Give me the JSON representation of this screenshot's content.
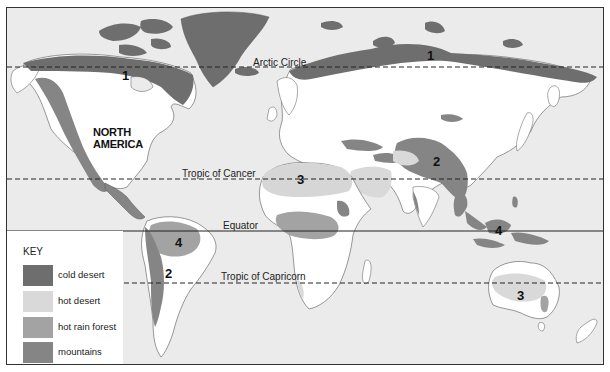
{
  "map": {
    "colors": {
      "ocean": "#ebebeb",
      "land": "#ffffff",
      "cold_desert": "#6e6e6e",
      "hot_desert": "#d6d6d6",
      "hot_rain_forest": "#a8a8a8",
      "mountains": "#8a8a8a",
      "outline": "#555555"
    },
    "lines": {
      "arctic_circle": "Arctic Circle",
      "tropic_of_cancer": "Tropic of Cancer",
      "equator": "Equator",
      "tropic_of_capricorn": "Tropic of Capricorn"
    },
    "labels": {
      "north_america_line1": "NORTH",
      "north_america_line2": "AMERICA"
    },
    "regions": [
      {
        "id": "na-cold-desert",
        "number": "1"
      },
      {
        "id": "eurasia-cold-desert",
        "number": "1"
      },
      {
        "id": "asia-mountains",
        "number": "2"
      },
      {
        "id": "andes-mountains",
        "number": "2"
      },
      {
        "id": "sahara-hot-desert",
        "number": "3"
      },
      {
        "id": "australia-hot-desert",
        "number": "3"
      },
      {
        "id": "amazon-rain-forest",
        "number": "4"
      },
      {
        "id": "indonesia-rain-forest",
        "number": "4"
      }
    ],
    "key": {
      "title": "KEY",
      "items": [
        {
          "label": "cold desert",
          "color": "#6e6e6e"
        },
        {
          "label": "hot desert",
          "color": "#d9d9d9"
        },
        {
          "label": "hot rain forest",
          "color": "#a3a3a3"
        },
        {
          "label": "mountains",
          "color": "#858585"
        }
      ]
    }
  }
}
